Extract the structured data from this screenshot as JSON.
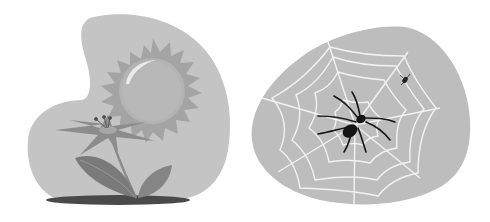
{
  "illustration": {
    "left_panel": {
      "subject": "sun and flower",
      "colors": {
        "blob": "#c4c4c4",
        "sun_rays": "#a4a4a4",
        "sun_disc": "#b0b0b0",
        "highlight": "#e8e8e8",
        "petals": "#8a8a8a",
        "leaves": "#7a7a7a",
        "shadow": "#4a4a4a"
      }
    },
    "right_panel": {
      "subject": "spider on web with small fly",
      "colors": {
        "blob": "#bdbdbd",
        "web": "#f2f2f2",
        "spider": "#151515"
      }
    }
  }
}
